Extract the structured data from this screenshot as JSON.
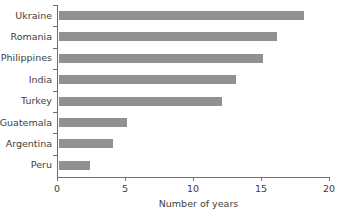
{
  "chart_data": {
    "type": "bar",
    "orientation": "horizontal",
    "title": "",
    "xlabel": "Number of years",
    "ylabel": "",
    "categories": [
      "Ukraine",
      "Romania",
      "Philippines",
      "India",
      "Turkey",
      "Guatemala",
      "Argentina",
      "Peru"
    ],
    "values": [
      18,
      16,
      15,
      13,
      12,
      5,
      4,
      2.3
    ],
    "xlim": [
      0,
      20
    ],
    "xticks": [
      0,
      5,
      10,
      15,
      20
    ],
    "xtick_labels": [
      "0",
      "5",
      "10",
      "15",
      "20"
    ],
    "grid": false,
    "legend": null,
    "series": [
      {
        "name": "Number of years",
        "color": "#919191",
        "values": [
          18,
          16,
          15,
          13,
          12,
          5,
          4,
          2.3
        ]
      }
    ],
    "colors": {
      "bar": "#919191",
      "axis": "#6f6f6f",
      "text": "#3d3d3d",
      "background": "#ffffff"
    }
  }
}
